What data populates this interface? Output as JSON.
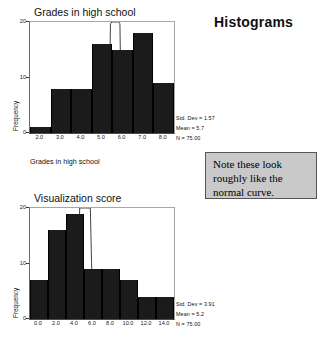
{
  "heading": "Histograms",
  "note": {
    "text": "Note these look roughly like the normal curve."
  },
  "chart_data": [
    {
      "type": "bar",
      "title": "Grades in high school",
      "xlabel": "Grades in high school",
      "ylabel": "Frequency",
      "xlim": [
        1.5,
        8.5
      ],
      "ylim": [
        0,
        20
      ],
      "yticks": [
        0,
        10,
        20
      ],
      "ytick_labels": [
        "0",
        "10",
        "20"
      ],
      "xticks": [
        2.0,
        3.0,
        4.0,
        5.0,
        6.0,
        7.0,
        8.0
      ],
      "xtick_labels": [
        "2.0",
        "3.0",
        "4.0",
        "5.0",
        "6.0",
        "7.0",
        "8.0"
      ],
      "bin_edges": [
        1.5,
        2.5,
        3.5,
        4.5,
        5.5,
        6.5,
        7.5,
        8.5
      ],
      "categories": [
        "1.5-2.5",
        "2.5-3.5",
        "3.5-4.5",
        "4.5-5.5",
        "5.5-6.5",
        "6.5-7.5",
        "7.5-8.5"
      ],
      "values": [
        1,
        8,
        8,
        16,
        15,
        18,
        9
      ],
      "grid": false,
      "overlay": "normal-curve",
      "stats": {
        "std_dev": "Std. Dev = 1.57",
        "mean": "Mean = 5.7",
        "n": "N = 75.00"
      }
    },
    {
      "type": "bar",
      "title": "Visualization score",
      "xlabel": "",
      "ylabel": "Frequency",
      "xlim": [
        -1,
        15
      ],
      "ylim": [
        0,
        20
      ],
      "yticks": [
        0,
        10,
        20
      ],
      "ytick_labels": [
        "0",
        "10",
        "20"
      ],
      "xticks": [
        0.0,
        2.0,
        4.0,
        6.0,
        8.0,
        10.0,
        12.0,
        14.0
      ],
      "xtick_labels": [
        "0.0",
        "2.0",
        "4.0",
        "6.0",
        "8.0",
        "10.0",
        "12.0",
        "14.0"
      ],
      "bin_edges": [
        -1,
        1,
        3,
        5,
        7,
        9,
        11,
        13,
        15
      ],
      "categories": [
        "-1-1",
        "1-3",
        "3-5",
        "5-7",
        "7-9",
        "9-11",
        "11-13",
        "13-15"
      ],
      "values": [
        7,
        16,
        19,
        9,
        9,
        7,
        4,
        4
      ],
      "grid": false,
      "overlay": "normal-curve",
      "stats": {
        "std_dev": "Std. Dev = 3.91",
        "mean": "Mean = 5.2",
        "n": "N = 75.00"
      }
    }
  ]
}
